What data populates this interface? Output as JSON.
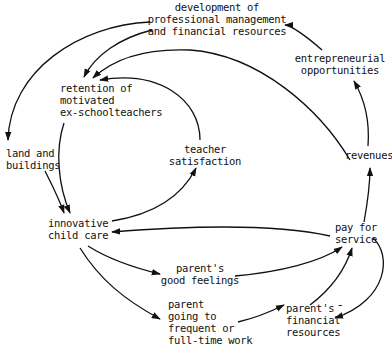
{
  "diagram": {
    "type": "causal-loop",
    "nodes": {
      "development": "development of\nprofessional management\nand financial resources",
      "entrepreneurial": "entrepreneurial\nopportunities",
      "retention": "retention of\nmotivated\nex-schoolteachers",
      "land": "land and\nbuildings",
      "teacher_satisfaction": "teacher\nsatisfaction",
      "revenues": "revenues",
      "innovative": "innovative\nchild care",
      "pay": "pay for\nservice",
      "good_feelings": "parent's\ngood feelings",
      "parent_work": "parent\ngoing to\nfrequent or\nfull-time work",
      "financial": "parent's\nfinancial\nresources"
    },
    "edges": [
      {
        "from": "development",
        "to": "retention"
      },
      {
        "from": "development",
        "to": "land"
      },
      {
        "from": "entrepreneurial",
        "to": "development"
      },
      {
        "from": "revenues",
        "to": "entrepreneurial"
      },
      {
        "from": "revenues",
        "to": "retention"
      },
      {
        "from": "teacher_satisfaction",
        "to": "retention"
      },
      {
        "from": "land",
        "to": "innovative"
      },
      {
        "from": "retention",
        "to": "innovative"
      },
      {
        "from": "innovative",
        "to": "teacher_satisfaction"
      },
      {
        "from": "pay",
        "to": "innovative"
      },
      {
        "from": "pay",
        "to": "revenues"
      },
      {
        "from": "innovative",
        "to": "good_feelings"
      },
      {
        "from": "innovative",
        "to": "parent_work"
      },
      {
        "from": "good_feelings",
        "to": "pay"
      },
      {
        "from": "parent_work",
        "to": "financial"
      },
      {
        "from": "financial",
        "to": "pay"
      },
      {
        "from": "pay",
        "to": "financial",
        "polarity": "-"
      }
    ],
    "negative_sign": "-"
  }
}
